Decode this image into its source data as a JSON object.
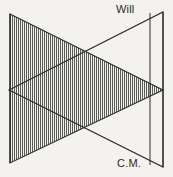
{
  "figure": {
    "background_color": "#f4f2ee",
    "ink_color": "#2b2b2b",
    "hatch_color": "#4a4a4a",
    "labels": {
      "top": "Will",
      "bottom": "C.M."
    },
    "geometry": {
      "left_edge_x": 10,
      "left_edge_top_y": 14,
      "left_edge_bottom_y": 163,
      "right_outer_x": 163,
      "right_outer_top_y": 12,
      "right_outer_bottom_y": 167,
      "right_inner_x": 150,
      "right_inner_top_y": 13,
      "right_inner_bottom_y": 165,
      "left_apex_x": 9,
      "left_apex_y": 90,
      "right_apex_x": 163,
      "right_apex_y": 90,
      "upper_cross_x": 86,
      "upper_cross_y": 51,
      "lower_cross_x": 86,
      "lower_cross_y": 129
    },
    "shapes": [
      {
        "name": "right-pointing-triangle",
        "label": "Will",
        "hatched": true,
        "points": "10,14 163,90 10,163"
      },
      {
        "name": "left-pointing-triangle",
        "label": "C.M.",
        "hatched": false,
        "points": "163,12 163,167 9,90"
      }
    ],
    "hatch": {
      "orientation": "vertical",
      "spacing_px": 2,
      "line_width_px": 1
    }
  }
}
